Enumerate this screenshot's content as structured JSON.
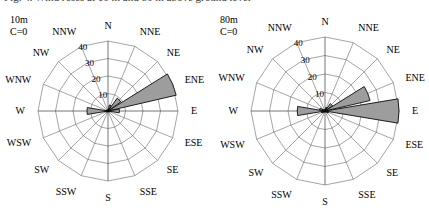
{
  "figure": {
    "caption_cutoff": "Fig. 4. Wind roses at 10 m and 80 m above ground level",
    "background_color": "#ffffff",
    "petal_fill_color": "#9d9d9d",
    "petal_stroke_color": "#000000",
    "grid_color": "#5a5a5a"
  },
  "chart_data": [
    {
      "type": "windrose",
      "title": "10m",
      "panel": "left",
      "calm_label": "C=0",
      "calm_value": 0,
      "categories": [
        "N",
        "NNE",
        "NE",
        "ENE",
        "E",
        "ESE",
        "SE",
        "SSE",
        "S",
        "SSW",
        "SW",
        "WSW",
        "W",
        "WNW",
        "NW",
        "NNW"
      ],
      "values": [
        0.8,
        3.5,
        9.0,
        40.0,
        6.5,
        1.0,
        0.6,
        0.5,
        0.4,
        0.5,
        0.8,
        1.2,
        12.0,
        1.0,
        0.6,
        0.5
      ],
      "radial_ticks": [
        10,
        20,
        30,
        40
      ],
      "rlim": [
        0,
        40
      ],
      "xlabel": "",
      "ylabel": "",
      "grid": true,
      "legend": "none",
      "note": "dominant sector ENE"
    },
    {
      "type": "windrose",
      "title": "80m",
      "panel": "right",
      "calm_label": "C=0",
      "calm_value": 0,
      "categories": [
        "N",
        "NNE",
        "NE",
        "ENE",
        "E",
        "ESE",
        "SE",
        "SSE",
        "S",
        "SSW",
        "SW",
        "WSW",
        "W",
        "WNW",
        "NW",
        "NNW"
      ],
      "values": [
        0.8,
        2.0,
        5.0,
        25.0,
        40.0,
        2.0,
        0.8,
        0.6,
        0.5,
        0.6,
        1.0,
        2.0,
        15.0,
        3.0,
        1.0,
        0.6
      ],
      "radial_ticks": [
        10,
        20,
        30,
        40
      ],
      "rlim": [
        0,
        40
      ],
      "xlabel": "",
      "ylabel": "",
      "grid": true,
      "legend": "none",
      "note": "dominant sector E"
    }
  ]
}
